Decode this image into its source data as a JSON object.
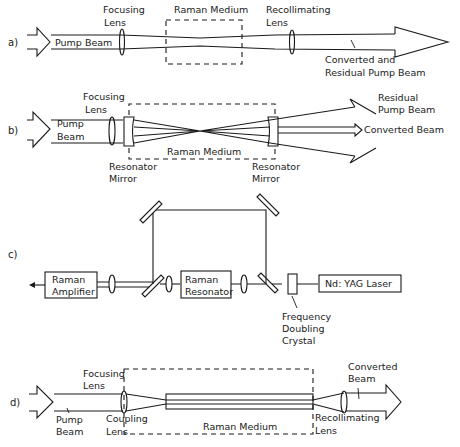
{
  "panels": {
    "a": {
      "label": "a)",
      "focusing_lens": [
        "Focusing",
        "Lens"
      ],
      "raman_medium": "Raman Medium",
      "recollimating_lens": [
        "Recollimating",
        "Lens"
      ],
      "pump_beam": "Pump Beam",
      "output": [
        "Converted and",
        "Residual Pump Beam"
      ]
    },
    "b": {
      "label": "b)",
      "focusing_lens": [
        "Focusing",
        "Lens"
      ],
      "pump_beam": [
        "Pump",
        "Beam"
      ],
      "raman_medium": "Raman Medium",
      "resonator_mirror_left": [
        "Resonator",
        "Mirror"
      ],
      "resonator_mirror_right": [
        "Resonator",
        "Mirror"
      ],
      "residual_pump": [
        "Residual",
        "Pump Beam"
      ],
      "converted_beam": "Converted Beam"
    },
    "c": {
      "label": "c)",
      "raman_amplifier": [
        "Raman",
        "Amplifier"
      ],
      "raman_resonator": [
        "Raman",
        "Resonator"
      ],
      "laser": "Nd: YAG Laser",
      "crystal": [
        "Frequency",
        "Doubling",
        "Crystal"
      ]
    },
    "d": {
      "label": "d)",
      "focusing_lens": [
        "Focusing",
        "Lens"
      ],
      "pump_beam": [
        "Pump",
        "Beam"
      ],
      "coupling_lens": [
        "Coupling",
        "Lens"
      ],
      "raman_medium": "Raman Medium",
      "converted_beam": [
        "Converted",
        "Beam"
      ],
      "recollimating_lens": [
        "Recollimating",
        "Lens"
      ]
    }
  }
}
